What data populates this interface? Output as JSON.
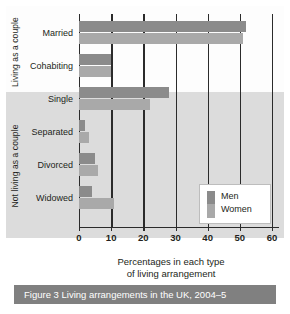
{
  "figure": {
    "caption": "Figure 3 Living arrangements in the UK, 2004–5"
  },
  "axis": {
    "title_line1": "Percentages in each type",
    "title_line2": "of living arrangement",
    "ticks": [
      "0",
      "10",
      "20",
      "30",
      "40",
      "50",
      "60"
    ]
  },
  "groups": [
    {
      "label": "Living as a couple"
    },
    {
      "label": "Not living as a couple"
    }
  ],
  "legend": {
    "items": [
      {
        "label": "Men",
        "color": "#8b8b8b"
      },
      {
        "label": "Women",
        "color": "#a9a9a9"
      }
    ]
  },
  "chart_data": {
    "type": "bar",
    "orientation": "horizontal",
    "title": "Figure 3 Living arrangements in the UK, 2004–5",
    "xlabel": "Percentages in each type of living arrangement",
    "ylabel": "",
    "xlim": [
      0,
      60
    ],
    "xticks": [
      0,
      10,
      20,
      30,
      40,
      50,
      60
    ],
    "grid": true,
    "legend_position": "inside-right",
    "categories": [
      "Married",
      "Cohabiting",
      "Single",
      "Separated",
      "Divorced",
      "Widowed"
    ],
    "category_groups": [
      {
        "label": "Living as a couple",
        "categories": [
          "Married",
          "Cohabiting"
        ]
      },
      {
        "label": "Not living as a couple",
        "categories": [
          "Single",
          "Separated",
          "Divorced",
          "Widowed"
        ]
      }
    ],
    "series": [
      {
        "name": "Men",
        "color": "#8b8b8b",
        "values": [
          52,
          10,
          28,
          2,
          5,
          4
        ]
      },
      {
        "name": "Women",
        "color": "#a9a9a9",
        "values": [
          51,
          10,
          22,
          3,
          6,
          11
        ]
      }
    ]
  }
}
